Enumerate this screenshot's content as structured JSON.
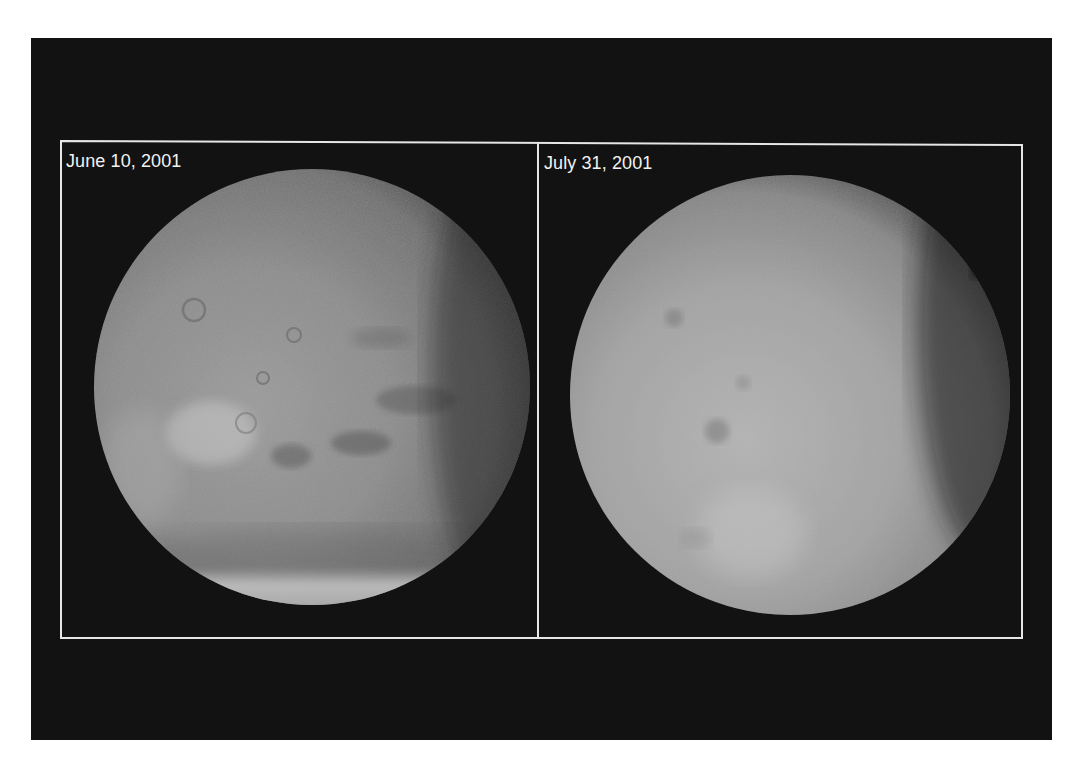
{
  "figure": {
    "panels": [
      {
        "label": "June 10, 2001",
        "subject": "Mars with clear atmosphere; surface features, volcanoes and south polar cap visible",
        "features": [
          "volcanic craters",
          "bright dust region",
          "dark albedo markings",
          "south polar cap"
        ]
      },
      {
        "label": "July 31, 2001",
        "subject": "Mars obscured by global dust storm; surface features mostly hidden",
        "features": [
          "faint dark spots",
          "uniform dusty haze"
        ]
      }
    ]
  },
  "colors": {
    "background": "#121212",
    "frame": "#e6e6e6",
    "label_text": "#f2f2f2",
    "page": "#ffffff"
  }
}
